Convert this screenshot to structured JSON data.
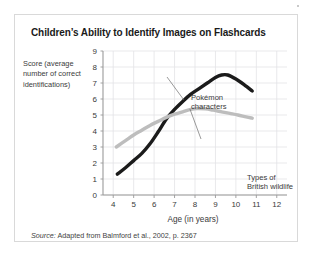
{
  "figure": {
    "title": "Children’s Ability to Identify Images on Flashcards",
    "ylabel_lines": "Score (average number of correct identifications)",
    "xlabel": "Age (in years)",
    "source_lead": "Source:",
    "source_text": " Adapted from Balmford et al., 2002, p. 2367",
    "annotations": {
      "pokemon_line1": "Pokémon",
      "pokemon_line2": "characters",
      "wildlife_line1": "Types of",
      "wildlife_line2": "British wildlife"
    },
    "colors": {
      "pokemon_series": "#1b1b1b",
      "wildlife_series": "#bdbdbd",
      "gridline": "#e3e3e6",
      "axis": "#9a9a9a",
      "card_border": "#d9d9d9",
      "title_text": "#1a1a1a",
      "body_text": "#3a3a3a"
    }
  },
  "chart_data": {
    "type": "line",
    "title": "Children’s Ability to Identify Images on Flashcards",
    "xlabel": "Age (in years)",
    "ylabel": "Score (average number of correct identifications)",
    "xlim": [
      3.5,
      12.5
    ],
    "ylim": [
      0,
      9
    ],
    "xticks": [
      4,
      5,
      6,
      7,
      8,
      9,
      10,
      11,
      12
    ],
    "yticks": [
      0,
      1,
      2,
      3,
      4,
      5,
      6,
      7,
      8,
      9
    ],
    "grid": true,
    "legend": "inline-annotations",
    "series": [
      {
        "name": "Pokémon characters",
        "color": "#1b1b1b",
        "points": [
          [
            4.2,
            1.3
          ],
          [
            4.6,
            1.7
          ],
          [
            5.0,
            2.15
          ],
          [
            5.4,
            2.6
          ],
          [
            5.8,
            3.2
          ],
          [
            6.2,
            3.95
          ],
          [
            6.6,
            4.75
          ],
          [
            7.0,
            5.35
          ],
          [
            7.4,
            5.85
          ],
          [
            7.8,
            6.3
          ],
          [
            8.2,
            6.65
          ],
          [
            8.6,
            7.0
          ],
          [
            9.0,
            7.35
          ],
          [
            9.3,
            7.5
          ],
          [
            9.6,
            7.5
          ],
          [
            10.0,
            7.25
          ],
          [
            10.4,
            6.9
          ],
          [
            10.8,
            6.5
          ]
        ]
      },
      {
        "name": "Types of British wildlife",
        "color": "#bdbdbd",
        "points": [
          [
            4.15,
            3.0
          ],
          [
            4.6,
            3.4
          ],
          [
            5.0,
            3.75
          ],
          [
            5.4,
            4.05
          ],
          [
            5.8,
            4.35
          ],
          [
            6.2,
            4.6
          ],
          [
            6.6,
            4.85
          ],
          [
            7.0,
            5.05
          ],
          [
            7.4,
            5.2
          ],
          [
            7.8,
            5.35
          ],
          [
            8.1,
            5.4
          ],
          [
            8.5,
            5.38
          ],
          [
            8.9,
            5.3
          ],
          [
            9.3,
            5.2
          ],
          [
            9.7,
            5.1
          ],
          [
            10.1,
            5.0
          ],
          [
            10.5,
            4.88
          ],
          [
            10.8,
            4.8
          ]
        ]
      }
    ],
    "crossover": {
      "x": 6.75,
      "y": 5.0
    }
  }
}
